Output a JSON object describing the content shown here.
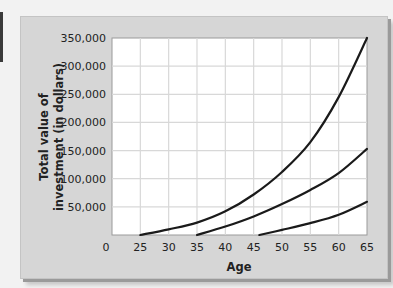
{
  "chart_data": {
    "type": "line",
    "title": "",
    "xlabel": "Age",
    "ylabel": "Total value of investment (in dollars)",
    "ylabel_lines": [
      "Total value of",
      "investment (in dollars)"
    ],
    "x_ticks": [
      "0",
      "25",
      "30",
      "35",
      "40",
      "45",
      "50",
      "55",
      "60",
      "65"
    ],
    "y_ticks": [
      "50,000",
      "100,000",
      "150,000",
      "200,000",
      "250,000",
      "300,000",
      "350,000"
    ],
    "xlim": [
      20,
      65
    ],
    "ylim": [
      0,
      350000
    ],
    "grid": true,
    "legend": null,
    "series": [
      {
        "name": "Start investing at 25",
        "x": [
          25,
          30,
          35,
          40,
          45,
          50,
          55,
          60,
          65
        ],
        "values": [
          0,
          10000,
          22000,
          42000,
          72000,
          112000,
          165000,
          245000,
          350000
        ]
      },
      {
        "name": "Start investing at 35",
        "x": [
          35,
          40,
          45,
          50,
          55,
          60,
          65
        ],
        "values": [
          0,
          15000,
          33000,
          55000,
          80000,
          110000,
          153000
        ]
      },
      {
        "name": "Start investing at 46",
        "x": [
          46,
          50,
          55,
          60,
          65
        ],
        "values": [
          0,
          9000,
          21000,
          36000,
          59000
        ]
      }
    ]
  },
  "colors": {
    "panel": "#d6d6d6",
    "plot_bg": "#ffffff",
    "grid": "#d8d8d8",
    "line": "#1a1a1a"
  }
}
